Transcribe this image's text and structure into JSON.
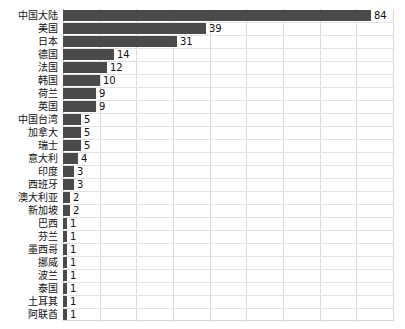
{
  "chart_data": {
    "type": "bar",
    "orientation": "horizontal",
    "title": "",
    "xlabel": "",
    "ylabel": "",
    "xlim": [
      0,
      90
    ],
    "grid": "vertical-and-horizontal",
    "legend": "none",
    "bar_color": "#4a4a4a",
    "gridline_color": "#d9d9d9",
    "text_color": "#111111",
    "background": "#ffffff",
    "gridline_interval": 10,
    "gridline_values": [
      0,
      10,
      20,
      30,
      40,
      50,
      60,
      70,
      80,
      90
    ],
    "categories": [
      "中国大陆",
      "美国",
      "日本",
      "德国",
      "法国",
      "韩国",
      "荷兰",
      "英国",
      "中国台湾",
      "加拿大",
      "瑞士",
      "意大利",
      "印度",
      "西班牙",
      "澳大利亚",
      "新加坡",
      "巴西",
      "芬兰",
      "墨西哥",
      "挪威",
      "波兰",
      "泰国",
      "土耳其",
      "阿联酋"
    ],
    "values": [
      84,
      39,
      31,
      14,
      12,
      10,
      9,
      9,
      5,
      5,
      5,
      4,
      3,
      3,
      2,
      2,
      1,
      1,
      1,
      1,
      1,
      1,
      1,
      1
    ],
    "data_labels": [
      "84",
      "39",
      "31",
      "14",
      "12",
      "10",
      "9",
      "9",
      "5",
      "5",
      "5",
      "4",
      "3",
      "3",
      "2",
      "2",
      "1",
      "1",
      "1",
      "1",
      "1",
      "1",
      "1",
      "1"
    ]
  }
}
